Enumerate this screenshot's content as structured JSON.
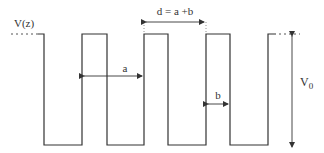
{
  "diagram": {
    "y_label": "V(z)",
    "period_label": "d = a +b",
    "well_width_label": "a",
    "barrier_width_label": "b",
    "height_label_main": "V",
    "height_label_sub": "0",
    "colors": {
      "line": "#333333",
      "background": "#ffffff"
    }
  }
}
